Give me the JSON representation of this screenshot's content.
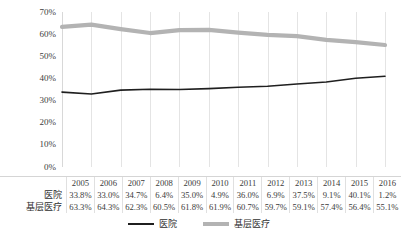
{
  "chart_data": {
    "type": "line",
    "title": "",
    "subtitle": "",
    "xlabel": "",
    "ylabel": "",
    "categories": [
      "2005",
      "2006",
      "2007",
      "2008",
      "2009",
      "2010",
      "2011",
      "2012",
      "2013",
      "2014",
      "2015",
      "2016"
    ],
    "ylim": [
      0,
      70
    ],
    "ytick_labels": [
      "0%",
      "10%",
      "20%",
      "30%",
      "40%",
      "50%",
      "60%",
      "70%"
    ],
    "ytick_values": [
      0,
      10,
      20,
      30,
      40,
      50,
      60,
      70
    ],
    "grid": "vertical-only",
    "legend_position": "bottom-center",
    "series": [
      {
        "name": "医院",
        "color": "#1f1f1f",
        "line_width": 1.6,
        "labels": [
          "33.8%",
          "33.0%",
          "34.7%",
          "6.4%",
          "35.0%",
          "4.9%",
          "36.0%",
          "6.9%",
          "37.5%",
          "9.1%",
          "40.1%",
          "1.2%"
        ],
        "values": [
          33.8,
          33.0,
          34.7,
          35.1,
          35.0,
          35.4,
          36.0,
          36.5,
          37.5,
          38.4,
          40.1,
          41.0
        ]
      },
      {
        "name": "基层医疗",
        "color": "#b3b3b3",
        "line_width": 4.2,
        "labels": [
          "63.3%",
          "64.3%",
          "62.3%",
          "60.5%",
          "61.8%",
          "61.9%",
          "60.7%",
          "59.7%",
          "59.1%",
          "57.4%",
          "56.4%",
          "55.1%"
        ],
        "values": [
          63.3,
          64.3,
          62.3,
          60.5,
          61.8,
          61.9,
          60.7,
          59.7,
          59.1,
          57.4,
          56.4,
          55.1
        ]
      }
    ]
  },
  "table": {
    "row_labels": [
      "医院",
      "基层医疗"
    ],
    "corner_label": ""
  },
  "legend": {
    "items": [
      {
        "label": "医院"
      },
      {
        "label": "基层医疗"
      }
    ]
  },
  "colors": {
    "hospital_line": "#1f1f1f",
    "primary_care_line": "#b3b3b3",
    "gridline": "#e4e4e4",
    "text": "#3a3a3a"
  }
}
